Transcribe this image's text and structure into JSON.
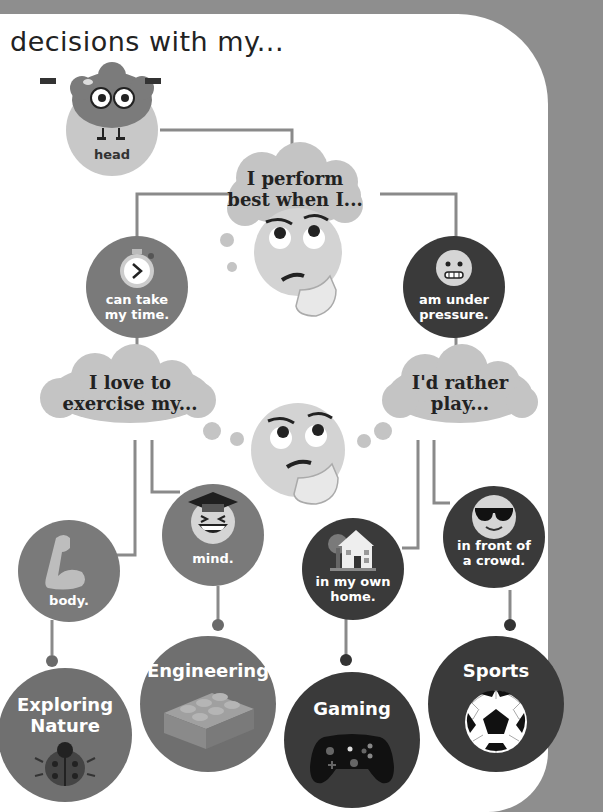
{
  "heading": "decisions with my...",
  "root": {
    "label": "head",
    "icon": "brain-with-dumbbells-icon"
  },
  "question1": {
    "text_line1": "I perform",
    "text_line2": "best when I...",
    "icon": "thinking-face-icon"
  },
  "answers1": [
    {
      "line1": "can take",
      "line2": "my time.",
      "icon": "stopwatch-icon"
    },
    {
      "line1": "am under",
      "line2": "pressure.",
      "icon": "grimacing-face-icon"
    }
  ],
  "question2a": {
    "text_line1": "I love to",
    "text_line2": "exercise my..."
  },
  "question2b": {
    "text_line1": "I'd rather",
    "text_line2": "play..."
  },
  "answers2": [
    {
      "label": "body.",
      "icon": "flexed-bicep-icon"
    },
    {
      "label": "mind.",
      "icon": "graduate-laughing-face-icon"
    },
    {
      "line1": "in my own",
      "line2": "home.",
      "icon": "house-icon"
    },
    {
      "line1": "in front of",
      "line2": "a crowd.",
      "icon": "sunglasses-face-icon"
    }
  ],
  "outcomes": [
    {
      "line1": "Exploring",
      "line2": "Nature",
      "icon": "ladybug-icon"
    },
    {
      "label": "Engineering",
      "icon": "lego-brick-icon"
    },
    {
      "label": "Gaming",
      "icon": "game-controller-icon"
    },
    {
      "label": "Sports",
      "icon": "soccer-ball-icon"
    }
  ],
  "colors": {
    "frame": "#8e8e8e",
    "page": "#ffffff",
    "light_node": "#c8c8c8",
    "mid_node": "#7a7a7a",
    "dark_node": "#3a3a3a",
    "line": "#7a7a7a"
  }
}
